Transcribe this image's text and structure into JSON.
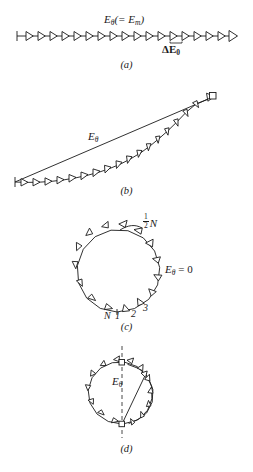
{
  "figure": {
    "title_present": false,
    "background_color": "#ffffff",
    "stroke_color": "#1a1a1a",
    "panels": [
      {
        "id": "a",
        "caption": "(a)",
        "description": "straight chain of equal phasors, zero phase difference",
        "labels": {
          "resultant": "E",
          "resultant_sub": "θ",
          "resultant_paren": "(= E",
          "resultant_paren_sub": "m",
          "resultant_paren_close": ")",
          "element": "ΔE",
          "element_sub": "0"
        },
        "arrow_count": 18
      },
      {
        "id": "b",
        "caption": "(b)",
        "description": "gently curved chain of phasors with straight resultant chord",
        "labels": {
          "resultant": "E",
          "resultant_sub": "θ"
        },
        "arrow_count": 18
      },
      {
        "id": "c",
        "caption": "(c)",
        "description": "phasor chain closed into a full circle, resultant is zero",
        "labels": {
          "half_n_num": "1",
          "half_n_den": "2",
          "half_n_symbol": "N",
          "resultant": "E",
          "resultant_sub": "θ",
          "resultant_eq": "= 0",
          "tick_N": "N",
          "tick_1": "1",
          "tick_2": "2",
          "tick_3": "3"
        },
        "arrow_count": 18
      },
      {
        "id": "d",
        "caption": "(d)",
        "description": "phasor chain wrapped more than a full circle, small resultant chord",
        "labels": {
          "resultant": "E",
          "resultant_sub": "θ"
        },
        "arrow_count": 18
      }
    ]
  }
}
